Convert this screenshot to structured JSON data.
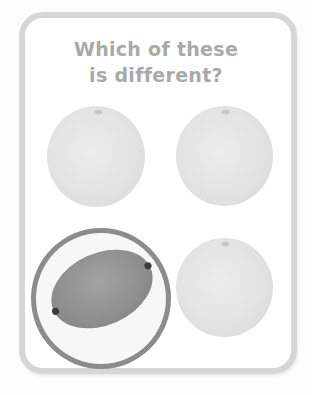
{
  "question": {
    "line1": "Which of these",
    "line2": "is different?"
  },
  "items": [
    {
      "name": "grapefruit",
      "position": "top-left",
      "selected": false
    },
    {
      "name": "grapefruit",
      "position": "top-right",
      "selected": false
    },
    {
      "name": "lemon",
      "position": "bottom-left",
      "selected": true
    },
    {
      "name": "grapefruit",
      "position": "bottom-right",
      "selected": false
    }
  ],
  "colors": {
    "card_border": "#d6d6d6",
    "title_text": "#a9a9a9",
    "highlight_ring": "#8c8c8c"
  }
}
